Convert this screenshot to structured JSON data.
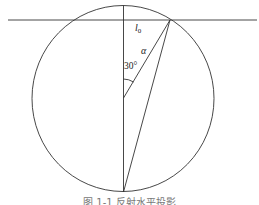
{
  "diagram": {
    "labels": {
      "l0": "l",
      "l0_sub": "0",
      "alpha": "α",
      "angle": "30°"
    },
    "caption": "图 1-1  反射水平投影",
    "colors": {
      "stroke": "#333333",
      "background": "#ffffff"
    }
  }
}
